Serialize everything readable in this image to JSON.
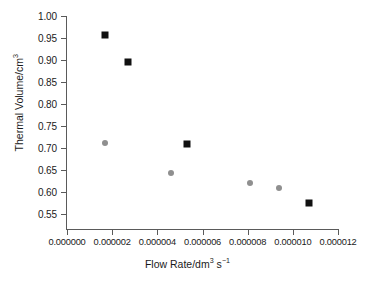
{
  "chart_data": {
    "type": "scatter",
    "title": "",
    "xlabel": "Flow Rate/dm3 s-1",
    "ylabel": "Thermal Volume/cm3",
    "xlim": [
      0.0,
      1.2e-05
    ],
    "ylim": [
      0.55,
      1.0
    ],
    "grid": false,
    "legend": "none",
    "x_ticks": [
      "0.000000",
      "0.000002",
      "0.000004",
      "0.000006",
      "0.000008",
      "0.000010",
      "0.000012"
    ],
    "x_tick_values": [
      0.0,
      2e-06,
      4e-06,
      6e-06,
      8e-06,
      1e-05,
      1.2e-05
    ],
    "y_ticks": [
      "0.55",
      "0.60",
      "0.65",
      "0.70",
      "0.75",
      "0.80",
      "0.85",
      "0.90",
      "0.95",
      "1.00"
    ],
    "y_tick_values": [
      0.55,
      0.6,
      0.65,
      0.7,
      0.75,
      0.8,
      0.85,
      0.9,
      0.95,
      1.0
    ],
    "series": [
      {
        "name": "black-squares",
        "marker": "square",
        "color": "#111111",
        "points": [
          {
            "x": 1.7e-06,
            "y": 0.957
          },
          {
            "x": 2.7e-06,
            "y": 0.896
          },
          {
            "x": 5.3e-06,
            "y": 0.71
          },
          {
            "x": 1.07e-05,
            "y": 0.574
          }
        ]
      },
      {
        "name": "gray-circles",
        "marker": "circle",
        "color": "#8f8f8f",
        "points": [
          {
            "x": 1.7e-06,
            "y": 0.712
          },
          {
            "x": 4.6e-06,
            "y": 0.643
          },
          {
            "x": 8.1e-06,
            "y": 0.621
          },
          {
            "x": 9.4e-06,
            "y": 0.608
          }
        ]
      }
    ]
  },
  "axis_titles": {
    "x": {
      "base": "Flow Rate/dm",
      "sup1": "3",
      "mid": " s",
      "sup2": "−1"
    },
    "y": {
      "base": "Thermal Volume/cm",
      "sup": "3"
    }
  }
}
